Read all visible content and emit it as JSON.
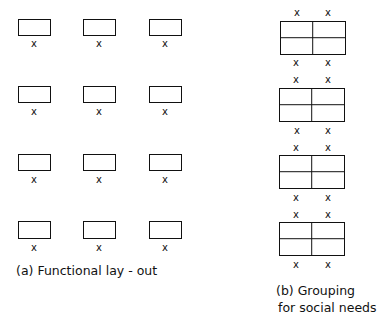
{
  "diagram": {
    "panel_a": {
      "caption": "(a)  Functional lay - out",
      "layout": "4 rows x 3 columns of single desks, each with one person (x) below",
      "rows": 4,
      "columns": 3,
      "person_mark": "x"
    },
    "panel_b": {
      "caption_line1": "(b) Grouping",
      "caption_line2": "for social needs",
      "layout": "4 clusters of 4 desks (2x2), each with 2 persons above and 2 below",
      "clusters": 4,
      "person_mark": "x"
    }
  }
}
